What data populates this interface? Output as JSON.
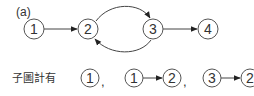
{
  "figure": {
    "label": "(a)",
    "graph": {
      "nodes": [
        {
          "id": "1",
          "label": "1"
        },
        {
          "id": "2",
          "label": "2"
        },
        {
          "id": "3",
          "label": "3"
        },
        {
          "id": "4",
          "label": "4"
        }
      ],
      "edges": [
        {
          "from": "1",
          "to": "2",
          "shape": "straight"
        },
        {
          "from": "2",
          "to": "3",
          "shape": "arc-top"
        },
        {
          "from": "3",
          "to": "2",
          "shape": "arc-bottom"
        },
        {
          "from": "3",
          "to": "4",
          "shape": "straight"
        }
      ]
    },
    "subgraphs": {
      "prefix": "子圖計有",
      "items": [
        {
          "nodes": [
            "1"
          ],
          "edges": []
        },
        {
          "nodes": [
            "1",
            "2"
          ],
          "edges": [
            {
              "from": "1",
              "to": "2"
            }
          ]
        },
        {
          "nodes": [
            "3",
            "2"
          ],
          "edges": [
            {
              "from": "3",
              "to": "2"
            }
          ]
        }
      ],
      "separator": ","
    }
  }
}
